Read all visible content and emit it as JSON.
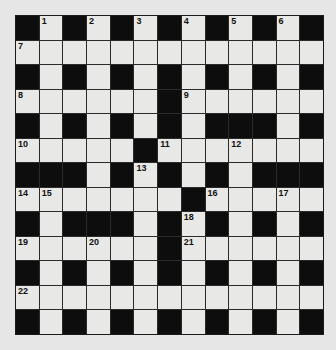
{
  "puzzle": {
    "rows": 13,
    "cols": 13,
    "colors": {
      "black": "#0d0d0d",
      "white": "#e8e8e6",
      "background": "#e6e6e6"
    },
    "layout": [
      "#.#.#.#.#.#.#",
      ".............",
      "#.#.#.#.#.#.#",
      "......#......",
      "#.#.#.#.###.#",
      ".....#.......",
      "###.#.#.#.###",
      ".......#.....",
      "#.###.#.#.#.#",
      "......#......",
      "#.#.#.#.#.#.#",
      ".............",
      "#.#.#.#.#.#.#"
    ],
    "numbers": [
      {
        "r": 0,
        "c": 1,
        "n": "1"
      },
      {
        "r": 0,
        "c": 3,
        "n": "2"
      },
      {
        "r": 0,
        "c": 5,
        "n": "3"
      },
      {
        "r": 0,
        "c": 7,
        "n": "4"
      },
      {
        "r": 0,
        "c": 9,
        "n": "5"
      },
      {
        "r": 0,
        "c": 11,
        "n": "6"
      },
      {
        "r": 1,
        "c": 0,
        "n": "7"
      },
      {
        "r": 3,
        "c": 0,
        "n": "8"
      },
      {
        "r": 3,
        "c": 7,
        "n": "9"
      },
      {
        "r": 5,
        "c": 0,
        "n": "10"
      },
      {
        "r": 5,
        "c": 6,
        "n": "11"
      },
      {
        "r": 5,
        "c": 9,
        "n": "12"
      },
      {
        "r": 6,
        "c": 5,
        "n": "13"
      },
      {
        "r": 7,
        "c": 0,
        "n": "14"
      },
      {
        "r": 7,
        "c": 1,
        "n": "15"
      },
      {
        "r": 7,
        "c": 8,
        "n": "16"
      },
      {
        "r": 7,
        "c": 11,
        "n": "17"
      },
      {
        "r": 8,
        "c": 7,
        "n": "18"
      },
      {
        "r": 9,
        "c": 0,
        "n": "19"
      },
      {
        "r": 9,
        "c": 3,
        "n": "20"
      },
      {
        "r": 9,
        "c": 7,
        "n": "21"
      },
      {
        "r": 11,
        "c": 0,
        "n": "22"
      }
    ]
  }
}
